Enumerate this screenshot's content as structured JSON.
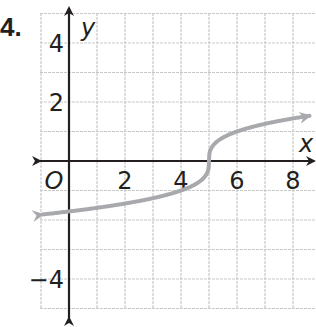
{
  "problem": {
    "number": "4."
  },
  "chart_data": {
    "type": "line",
    "title": "",
    "xlabel": "x",
    "ylabel": "y",
    "origin_label": "O",
    "xlim": [
      -1,
      8.8
    ],
    "ylim": [
      -5,
      5
    ],
    "grid": true,
    "grid_step": 1,
    "x_tick_labels": [
      "2",
      "4",
      "6",
      "8"
    ],
    "x_ticks": [
      2,
      4,
      6,
      8
    ],
    "y_tick_labels": [
      "4",
      "2",
      "−4"
    ],
    "y_ticks": [
      4,
      2,
      -4
    ],
    "series": [
      {
        "name": "y = cbrt(x - 5)",
        "color": "#a7a9ac",
        "arrows": "both",
        "x": [
          -1,
          0,
          1,
          2,
          3,
          4,
          4.5,
          4.9,
          5,
          5.1,
          5.5,
          6,
          7,
          8,
          8.6
        ],
        "y": [
          -1.82,
          -1.71,
          -1.59,
          -1.44,
          -1.26,
          -1.0,
          -0.79,
          -0.46,
          0,
          0.46,
          0.79,
          1.0,
          1.26,
          1.44,
          1.53
        ]
      }
    ],
    "colors": {
      "axis": "#231f20",
      "grid": "#c9c9c9",
      "curve": "#a7a9ac"
    }
  }
}
